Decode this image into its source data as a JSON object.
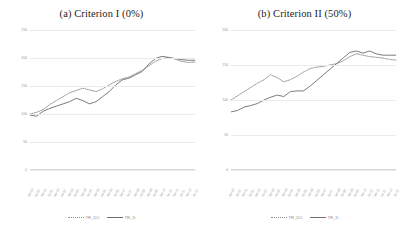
{
  "figure": {
    "background": "#ffffff",
    "line_color_solid": "#6e6c6c",
    "line_color_dotted": "#8d8b8b"
  },
  "panels": [
    {
      "id": "panel-a",
      "title": "(a) Criterion I (0%)",
      "legend": [
        {
          "label": "TR_DC",
          "style": "dotted"
        },
        {
          "label": "TR_D",
          "style": "solid"
        }
      ]
    },
    {
      "id": "panel-b",
      "title": "(b) Criterion II (50%)",
      "legend": [
        {
          "label": "TR_DC",
          "style": "dotted"
        },
        {
          "label": "TR_D",
          "style": "solid"
        }
      ]
    }
  ],
  "chart_data": [
    {
      "type": "line",
      "title": "(a) Criterion I (0%)",
      "xlabel": "",
      "ylabel": "",
      "ylim": [
        0,
        250
      ],
      "yticks": [
        0,
        50,
        100,
        150,
        200,
        250
      ],
      "grid": true,
      "legend_position": "bottom",
      "categories": [
        "Jan-00",
        "Jul-00",
        "Jan-01",
        "Jul-01",
        "Jan-02",
        "Jul-02",
        "Jan-03",
        "Jul-03",
        "Jan-04",
        "Jul-04",
        "Jan-05",
        "Jul-05",
        "Jan-06",
        "Jul-06",
        "Jan-07",
        "Jul-07",
        "Jan-08",
        "Jul-08",
        "Jan-09",
        "Jul-09",
        "Jan-10",
        "Jul-10",
        "Jan-11",
        "Jul-11",
        "Jan-12",
        "Jul-12"
      ],
      "series": [
        {
          "name": "TR_DC",
          "style": "dotted",
          "values": [
            100,
            103,
            108,
            117,
            124,
            131,
            138,
            142,
            146,
            143,
            140,
            145,
            152,
            158,
            163,
            166,
            172,
            178,
            186,
            194,
            199,
            201,
            198,
            194,
            192,
            193
          ]
        },
        {
          "name": "TR_D",
          "style": "solid",
          "values": [
            98,
            96,
            105,
            110,
            114,
            118,
            122,
            128,
            124,
            118,
            122,
            131,
            140,
            152,
            161,
            164,
            170,
            176,
            189,
            199,
            203,
            201,
            199,
            197,
            196,
            196
          ]
        }
      ]
    },
    {
      "type": "line",
      "title": "(b) Criterion II (50%)",
      "xlabel": "",
      "ylabel": "",
      "ylim": [
        0,
        200
      ],
      "yticks": [
        0,
        50,
        100,
        150,
        200
      ],
      "grid": true,
      "legend_position": "bottom",
      "categories": [
        "Jan-00",
        "Jul-00",
        "Jan-01",
        "Jul-01",
        "Jan-02",
        "Jul-02",
        "Jan-03",
        "Jul-03",
        "Jan-04",
        "Jul-04",
        "Jan-05",
        "Jul-05",
        "Jan-06",
        "Jul-06",
        "Jan-07",
        "Jul-07",
        "Jan-08",
        "Jul-08",
        "Jan-09",
        "Jul-09",
        "Jan-10",
        "Jul-10",
        "Jan-11",
        "Jul-11",
        "Jan-12",
        "Jul-12"
      ],
      "series": [
        {
          "name": "TR_DC",
          "style": "dotted",
          "values": [
            100,
            106,
            112,
            118,
            124,
            129,
            136,
            132,
            126,
            129,
            134,
            140,
            145,
            147,
            148,
            150,
            152,
            156,
            162,
            166,
            164,
            162,
            161,
            160,
            158,
            157
          ]
        },
        {
          "name": "TR_D",
          "style": "solid",
          "values": [
            83,
            85,
            90,
            92,
            95,
            100,
            104,
            107,
            105,
            112,
            113,
            113,
            120,
            128,
            136,
            144,
            152,
            160,
            168,
            170,
            167,
            170,
            166,
            164,
            164,
            164
          ]
        }
      ]
    }
  ]
}
